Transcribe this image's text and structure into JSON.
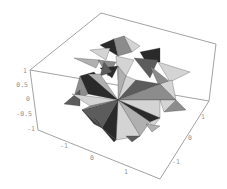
{
  "figure": {
    "type": "3d-polyhedron-plot",
    "colors": {
      "box": "#8a8a8a",
      "tick_text": "#909090",
      "light": "#d4d4d4",
      "mid": "#8c8c8c",
      "dark": "#2a2a2a",
      "midlight": "#b0b0b0",
      "middark": "#5c5c5c"
    }
  },
  "axes": {
    "z": {
      "ticks": [
        "1",
        "0.5",
        "0",
        "-0.5",
        "-1"
      ]
    },
    "x": {
      "ticks": [
        "-1",
        "0",
        "1"
      ]
    },
    "y": {
      "ticks": [
        "-1",
        "0",
        "1"
      ]
    }
  }
}
